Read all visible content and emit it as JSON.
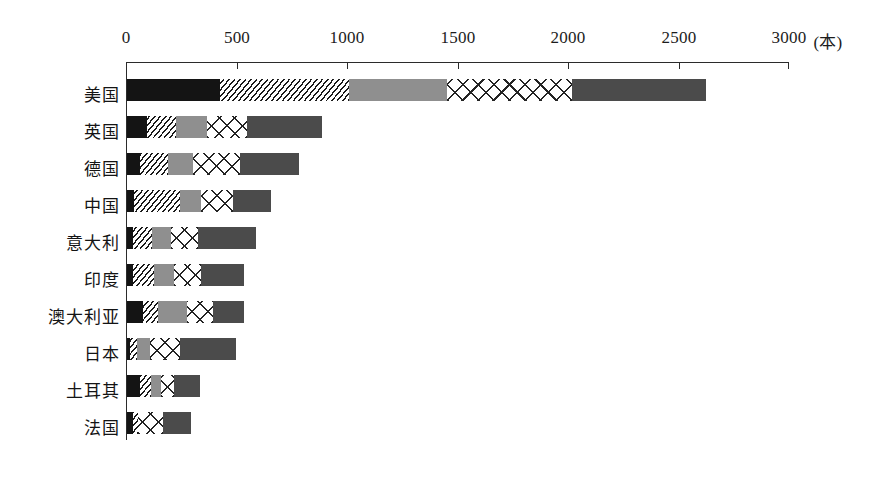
{
  "chart_data": {
    "type": "bar",
    "orientation": "horizontal",
    "stacked": true,
    "title": "",
    "subtitle": "",
    "xlabel": "(本)",
    "ylabel": "",
    "xlim": [
      0,
      3000
    ],
    "x_ticks": [
      0,
      500,
      1000,
      1500,
      2000,
      2500,
      3000
    ],
    "x_tick_labels": [
      "0",
      "500",
      "1000",
      "1500",
      "2000",
      "2500",
      "3000"
    ],
    "unit_label": "(本)",
    "grid": false,
    "legend": "none",
    "categories": [
      "美国",
      "英国",
      "德国",
      "中国",
      "意大利",
      "印度",
      "澳大利亚",
      "日本",
      "土耳其",
      "法国"
    ],
    "series": [
      {
        "name": "series-1",
        "pattern": "solid-black",
        "color": "#141414",
        "values": [
          420,
          90,
          57,
          32,
          27,
          27,
          71,
          14,
          57,
          27
        ]
      },
      {
        "name": "series-2",
        "pattern": "diagonal-hatch",
        "color": "#1a1a1a",
        "values": [
          585,
          132,
          127,
          208,
          86,
          95,
          71,
          33,
          52,
          25
        ]
      },
      {
        "name": "series-3",
        "pattern": "medium-gray",
        "color": "#8f8f8f",
        "values": [
          445,
          141,
          113,
          96,
          86,
          89,
          132,
          57,
          43,
          0
        ]
      },
      {
        "name": "series-4",
        "pattern": "crosshatch-x",
        "color": "#242424",
        "values": [
          565,
          179,
          217,
          146,
          122,
          125,
          118,
          136,
          61,
          113
        ]
      },
      {
        "name": "series-5",
        "pattern": "dark-gray",
        "color": "#4b4b4b",
        "values": [
          610,
          340,
          264,
          169,
          264,
          193,
          137,
          255,
          117,
          123
        ]
      }
    ],
    "totals": [
      2625,
      882,
      778,
      651,
      585,
      529,
      529,
      495,
      330,
      288
    ]
  },
  "axis": {
    "tick_0": "0",
    "tick_500": "500",
    "tick_1000": "1000",
    "tick_1500": "1500",
    "tick_2000": "2000",
    "tick_2500": "2500",
    "tick_3000": "3000",
    "unit": "(本)"
  },
  "categories": {
    "c0": "美国",
    "c1": "英国",
    "c2": "德国",
    "c3": "中国",
    "c4": "意大利",
    "c5": "印度",
    "c6": "澳大利亚",
    "c7": "日本",
    "c8": "土耳其",
    "c9": "法国"
  }
}
